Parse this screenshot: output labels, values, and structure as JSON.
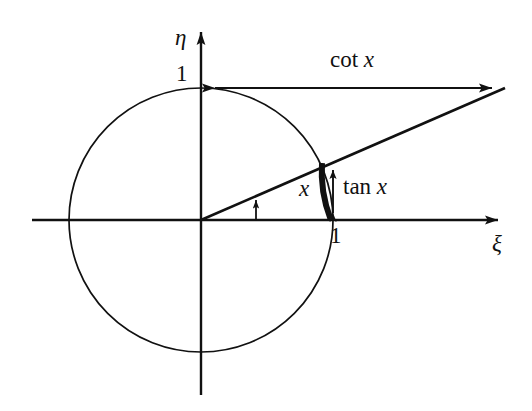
{
  "figure": {
    "background_color": "#ffffff",
    "stroke_color": "#111111"
  },
  "axes": {
    "horizontal": {
      "name": "xi-axis",
      "label": "ξ",
      "label_position": {
        "x": 492,
        "y": 232
      },
      "start": {
        "x": 32,
        "y": 220
      },
      "end": {
        "x": 510,
        "y": 220
      },
      "arrow": "right"
    },
    "vertical": {
      "name": "eta-axis",
      "label": "η",
      "label_position": {
        "x": 175,
        "y": 26
      },
      "start": {
        "x": 201,
        "y": 395
      },
      "end": {
        "x": 201,
        "y": 20
      },
      "arrow": "up"
    },
    "origin": {
      "x": 201,
      "y": 220
    }
  },
  "unit_circle": {
    "name": "unit-circle",
    "center": {
      "x": 201,
      "y": 220
    },
    "radius": 132,
    "stroke_width": 1.6
  },
  "tick_labels": [
    {
      "name": "tick-one-eta",
      "text": "1",
      "axis": "eta",
      "value": 1,
      "point": {
        "x": 201,
        "y": 88
      }
    },
    {
      "name": "tick-one-xi",
      "text": "1",
      "axis": "xi",
      "value": 1,
      "point": {
        "x": 333,
        "y": 220
      }
    }
  ],
  "segments": {
    "cot": {
      "name": "cot-segment",
      "label": "cot x",
      "label_function": "cot",
      "label_variable": "x",
      "from": {
        "x": 204,
        "y": 88
      },
      "to": {
        "x": 505,
        "y": 88
      },
      "arrows": "both"
    },
    "tan": {
      "name": "tan-segment",
      "label": "tan x",
      "label_function": "tan",
      "label_variable": "x",
      "from": {
        "x": 333,
        "y": 220
      },
      "to": {
        "x": 333,
        "y": 163
      },
      "arrows": "both"
    },
    "ray": {
      "name": "terminal-ray",
      "from": {
        "x": 201,
        "y": 220
      },
      "to": {
        "x": 505,
        "y": 88
      },
      "circle_intersection": {
        "x": 322,
        "y": 163
      }
    }
  },
  "arc_label": {
    "name": "arc-length-x",
    "text": "x",
    "meaning": "arc length x on the unit circle",
    "arc_from": {
      "x": 322,
      "y": 163
    },
    "arc_to": {
      "x": 330,
      "y": 219
    },
    "label_position": {
      "x": 299,
      "y": 177
    }
  },
  "angle_indicator": {
    "name": "angle-indicator-arrow",
    "from": {
      "x": 256,
      "y": 220
    },
    "to": {
      "x": 256,
      "y": 200
    },
    "arrow": "up"
  }
}
